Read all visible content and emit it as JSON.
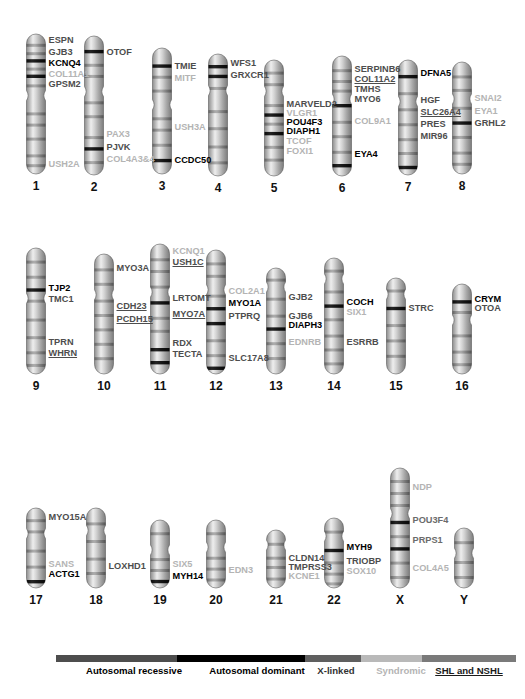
{
  "figure": {
    "colors": {
      "autosomal_recessive": "#4d4d4d",
      "autosomal_dominant": "#000000",
      "x_linked": "#6b6b6b",
      "syndromic": "#b4b4b4",
      "shl_and_nshl": "#7a7a7a",
      "background": "#ffffff"
    }
  },
  "legend": {
    "items": [
      {
        "label": "Autosomal recessive",
        "color": "#4d4d4d",
        "style": "recessive"
      },
      {
        "label": "Autosomal dominant",
        "color": "#000000",
        "style": "dominant"
      },
      {
        "label": "X-linked",
        "color": "#5f5f5f",
        "style": "xlinked"
      },
      {
        "label": "Syndromic",
        "color": "#b9b9b9",
        "style": "syndromic"
      },
      {
        "label": "SHL and NSHL",
        "color": "#7a7a7a",
        "style": "underline"
      }
    ]
  },
  "chromosomes": [
    {
      "id": "1",
      "label": "1",
      "genes": [
        {
          "name": "ESPN",
          "class": "ar"
        },
        {
          "name": "GJB3",
          "class": "ar"
        },
        {
          "name": "KCNQ4",
          "class": "ad"
        },
        {
          "name": "COL11A1",
          "class": "syn"
        },
        {
          "name": "GPSM2",
          "class": "ar"
        },
        {
          "name": "USH2A",
          "class": "syn"
        }
      ]
    },
    {
      "id": "2",
      "label": "2",
      "genes": [
        {
          "name": "OTOF",
          "class": "ar"
        },
        {
          "name": "PAX3",
          "class": "syn"
        },
        {
          "name": "PJVK",
          "class": "ar"
        },
        {
          "name": "COL4A3&4",
          "class": "syn"
        }
      ]
    },
    {
      "id": "3",
      "label": "3",
      "genes": [
        {
          "name": "TMIE",
          "class": "ar"
        },
        {
          "name": "MITF",
          "class": "syn"
        },
        {
          "name": "USH3A",
          "class": "syn"
        },
        {
          "name": "CCDC50",
          "class": "ad"
        }
      ]
    },
    {
      "id": "4",
      "label": "4",
      "genes": [
        {
          "name": "WFS1",
          "class": "ar"
        },
        {
          "name": "GRXCR1",
          "class": "ar"
        }
      ]
    },
    {
      "id": "5",
      "label": "5",
      "genes": [
        {
          "name": "MARVELD2",
          "class": "ar"
        },
        {
          "name": "VLGR1",
          "class": "syn"
        },
        {
          "name": "POU4F3",
          "class": "ad"
        },
        {
          "name": "DIAPH1",
          "class": "ad"
        },
        {
          "name": "TCOF",
          "class": "syn"
        },
        {
          "name": "FOXI1",
          "class": "syn"
        }
      ]
    },
    {
      "id": "6",
      "label": "6",
      "genes": [
        {
          "name": "SERPINB6",
          "class": "ar"
        },
        {
          "name": "COL11A2",
          "class": "ar",
          "underline": true
        },
        {
          "name": "TMHS",
          "class": "ar"
        },
        {
          "name": "MYO6",
          "class": "ar"
        },
        {
          "name": "COL9A1",
          "class": "syn"
        },
        {
          "name": "EYA4",
          "class": "ad"
        }
      ]
    },
    {
      "id": "7",
      "label": "7",
      "genes": [
        {
          "name": "DFNA5",
          "class": "ad"
        },
        {
          "name": "HGF",
          "class": "ar"
        },
        {
          "name": "SLC26A4",
          "class": "ar",
          "underline": true
        },
        {
          "name": "PRES",
          "class": "ar"
        },
        {
          "name": "MIR96",
          "class": "ar"
        }
      ]
    },
    {
      "id": "8",
      "label": "8",
      "genes": [
        {
          "name": "SNAI2",
          "class": "syn"
        },
        {
          "name": "EYA1",
          "class": "syn"
        },
        {
          "name": "GRHL2",
          "class": "ar"
        }
      ]
    },
    {
      "id": "9",
      "label": "9",
      "genes": [
        {
          "name": "TJP2",
          "class": "ad"
        },
        {
          "name": "TMC1",
          "class": "ar"
        },
        {
          "name": "TPRN",
          "class": "ar"
        },
        {
          "name": "WHRN",
          "class": "ar",
          "underline": true
        }
      ]
    },
    {
      "id": "10",
      "label": "10",
      "genes": [
        {
          "name": "MYO3A",
          "class": "ar"
        },
        {
          "name": "CDH23",
          "class": "ar",
          "underline": true
        },
        {
          "name": "PCDH15",
          "class": "ar",
          "underline": true
        }
      ]
    },
    {
      "id": "11",
      "label": "11",
      "genes": [
        {
          "name": "KCNQ1",
          "class": "syn"
        },
        {
          "name": "USH1C",
          "class": "ar",
          "underline": true
        },
        {
          "name": "LRTOMT",
          "class": "ar"
        },
        {
          "name": "MYO7A",
          "class": "ar",
          "underline": true
        },
        {
          "name": "RDX",
          "class": "ar"
        },
        {
          "name": "TECTA",
          "class": "ar"
        }
      ]
    },
    {
      "id": "12",
      "label": "12",
      "genes": [
        {
          "name": "COL2A1",
          "class": "syn"
        },
        {
          "name": "MYO1A",
          "class": "ad"
        },
        {
          "name": "PTPRQ",
          "class": "ar"
        },
        {
          "name": "SLC17A8",
          "class": "ar"
        }
      ]
    },
    {
      "id": "13",
      "label": "13",
      "genes": [
        {
          "name": "GJB2",
          "class": "ar"
        },
        {
          "name": "GJB6",
          "class": "ar"
        },
        {
          "name": "DIAPH3",
          "class": "ad"
        },
        {
          "name": "EDNRB",
          "class": "syn"
        }
      ]
    },
    {
      "id": "14",
      "label": "14",
      "genes": [
        {
          "name": "COCH",
          "class": "ad"
        },
        {
          "name": "SIX1",
          "class": "syn"
        },
        {
          "name": "ESRRB",
          "class": "ar"
        }
      ]
    },
    {
      "id": "15",
      "label": "15",
      "genes": [
        {
          "name": "STRC",
          "class": "ar"
        }
      ]
    },
    {
      "id": "16",
      "label": "16",
      "genes": [
        {
          "name": "CRYM",
          "class": "ad"
        },
        {
          "name": "OTOA",
          "class": "ar"
        }
      ]
    },
    {
      "id": "17",
      "label": "17",
      "genes": [
        {
          "name": "MYO15A",
          "class": "ar"
        },
        {
          "name": "SANS",
          "class": "syn"
        },
        {
          "name": "ACTG1",
          "class": "ad"
        }
      ]
    },
    {
      "id": "18",
      "label": "18",
      "genes": [
        {
          "name": "LOXHD1",
          "class": "ar"
        }
      ]
    },
    {
      "id": "19",
      "label": "19",
      "genes": [
        {
          "name": "SIX5",
          "class": "syn"
        },
        {
          "name": "MYH14",
          "class": "ad"
        }
      ]
    },
    {
      "id": "20",
      "label": "20",
      "genes": [
        {
          "name": "EDN3",
          "class": "syn"
        }
      ]
    },
    {
      "id": "21",
      "label": "21",
      "genes": [
        {
          "name": "CLDN14",
          "class": "ar"
        },
        {
          "name": "TMPRSS3",
          "class": "ar"
        },
        {
          "name": "KCNE1",
          "class": "syn"
        }
      ]
    },
    {
      "id": "22",
      "label": "22",
      "genes": [
        {
          "name": "MYH9",
          "class": "ad"
        },
        {
          "name": "TRIOBP",
          "class": "ar"
        },
        {
          "name": "SOX10",
          "class": "syn"
        }
      ]
    },
    {
      "id": "X",
      "label": "X",
      "genes": [
        {
          "name": "NDP",
          "class": "syn"
        },
        {
          "name": "POU3F4",
          "class": "xl"
        },
        {
          "name": "PRPS1",
          "class": "xl"
        },
        {
          "name": "COL4A5",
          "class": "syn"
        }
      ]
    },
    {
      "id": "Y",
      "label": "Y",
      "genes": []
    }
  ]
}
